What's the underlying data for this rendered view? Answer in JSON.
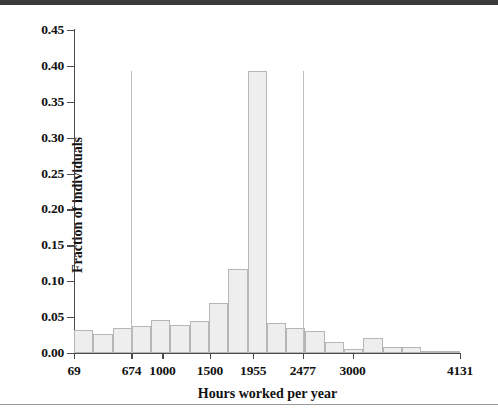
{
  "figure": {
    "top_band_color": "#3b3b3b",
    "background": "#ffffff",
    "bar_fill": "#eeeeee",
    "bar_stroke": "#b6b6b6",
    "axis_color": "#4a4a4a"
  },
  "chart_data": {
    "type": "bar",
    "title": "",
    "subtitle": "",
    "xlabel": "Hours worked per year",
    "ylabel": "Fraction of individuals",
    "ylim": [
      0.0,
      0.45
    ],
    "xlim": [
      69,
      4131
    ],
    "grid": false,
    "legend": null,
    "ytick_labels": [
      "0.00",
      "0.05",
      "0.10",
      "0.15",
      "0.20",
      "0.25",
      "0.30",
      "0.35",
      "0.40",
      "0.45"
    ],
    "ytick_values": [
      0.0,
      0.05,
      0.1,
      0.15,
      0.2,
      0.25,
      0.3,
      0.35,
      0.4,
      0.45
    ],
    "xtick_labels": [
      "69",
      "674",
      "1000",
      "1500",
      "1955",
      "2477",
      "3000",
      "4131"
    ],
    "xtick_values": [
      69,
      674,
      1000,
      1500,
      1955,
      2477,
      3000,
      4131
    ],
    "bin_edges": [
      69,
      272,
      475,
      678,
      881,
      1084,
      1287,
      1490,
      1693,
      1896,
      2099,
      2302,
      2505,
      2708,
      2911,
      3114,
      3317,
      3520,
      3723,
      3926,
      4131
    ],
    "values": [
      0.032,
      0.027,
      0.035,
      0.038,
      0.046,
      0.039,
      0.045,
      0.069,
      0.117,
      0.393,
      0.042,
      0.035,
      0.03,
      0.016,
      0.006,
      0.021,
      0.008,
      0.009,
      0.003,
      0.001
    ],
    "annotations": [
      {
        "name": "reference-line-left",
        "x": 674,
        "y_top": 0.393
      },
      {
        "name": "reference-line-right",
        "x": 2477,
        "y_top": 0.393
      }
    ]
  }
}
